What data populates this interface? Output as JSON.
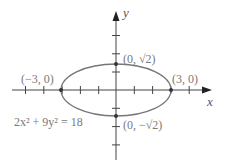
{
  "figure": {
    "equation": "2x² + 9y² = 18",
    "x_axis_label": "x",
    "y_axis_label": "y",
    "points": {
      "left": "(−3, 0)",
      "right": "(3, 0)",
      "top": "(0, √2)",
      "bottom": "(0, −√2)"
    },
    "colors": {
      "axis": "#444444",
      "ellipse": "#777777",
      "label": "#7a7a7a"
    }
  }
}
